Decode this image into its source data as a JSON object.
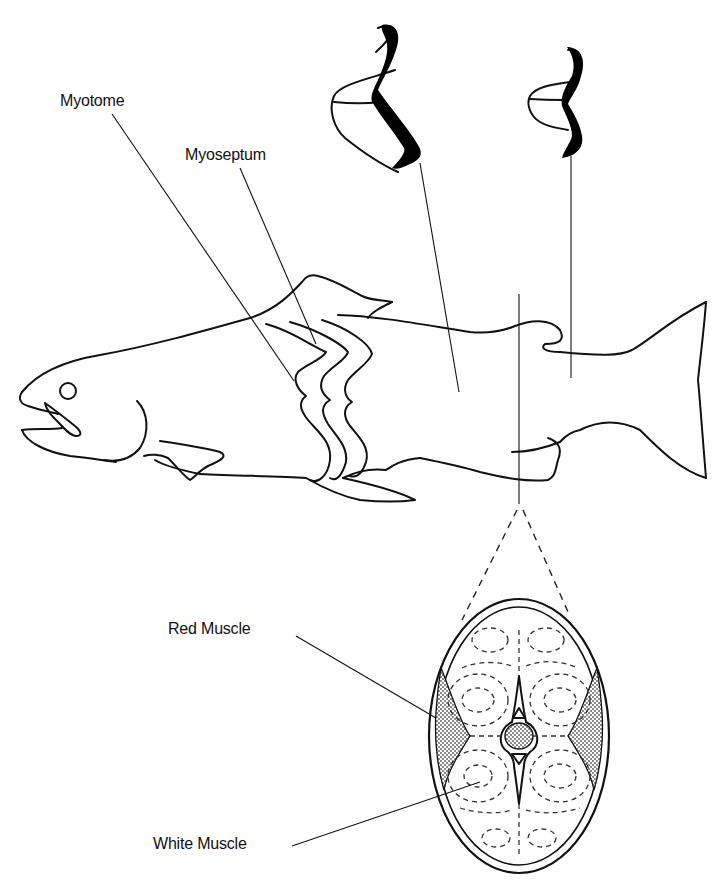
{
  "figure": {
    "labels": {
      "myotome": "Myotome",
      "myoseptum": "Myoseptum",
      "red_muscle": "Red Muscle",
      "white_muscle": "White Muscle"
    },
    "parts": [
      "fish-outline",
      "myoseptum-zigzags",
      "myotome-3d-cone-large",
      "myotome-3d-cone-small",
      "cross-section-inset",
      "vertebral-column",
      "red-muscle-band-left",
      "red-muscle-band-right"
    ],
    "colors": {
      "line": "#111111",
      "background": "#ffffff",
      "stipple": "#555555"
    }
  }
}
